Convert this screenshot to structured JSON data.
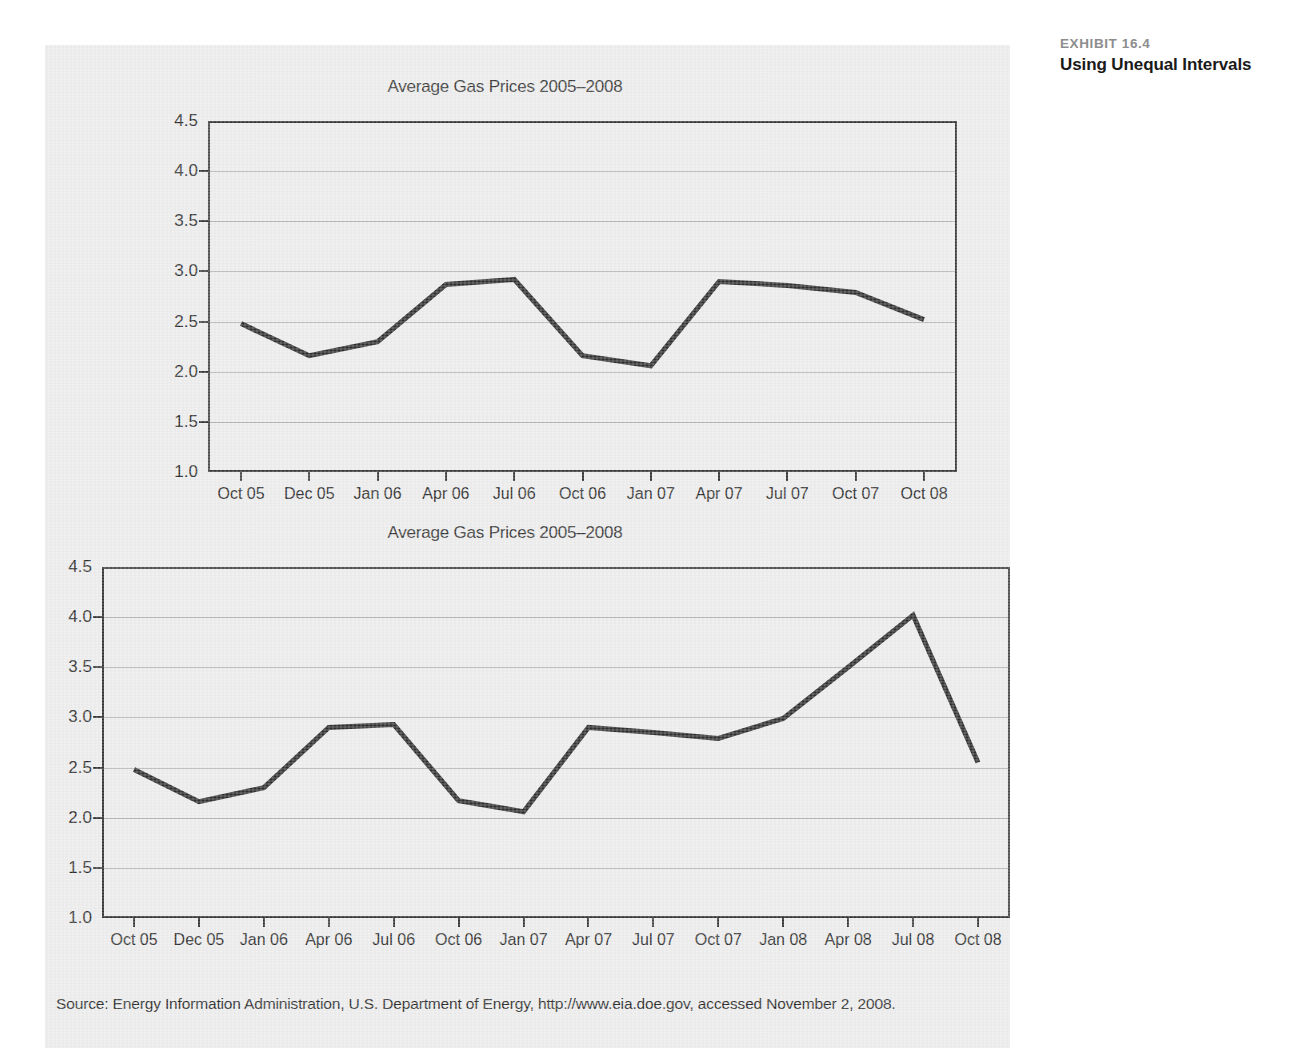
{
  "exhibit": {
    "number": "EXHIBIT 16.4",
    "title": "Using Unequal Intervals"
  },
  "credit": "COURTESY, ENERGY INFORMATION SERVICE, U.S. GOVERNMENT",
  "source_note": "Source: Energy Information Administration, U.S. Department of Energy, http://www.eia.doe.gov, accessed November 2, 2008.",
  "colors": {
    "panel_background": "#ebebeb",
    "line": "#222222",
    "axis": "#2a2a2a",
    "grid": "#9a9a9a",
    "text": "#1d1d1d",
    "exhibit_number": "#8d8d8d"
  },
  "chart_data": [
    {
      "type": "line",
      "id": "top-chart",
      "title": "Average Gas Prices 2005–2008",
      "xlabel": "",
      "ylabel": "",
      "ylim": [
        1.0,
        4.5
      ],
      "yticks": [
        "4.5",
        "4.0",
        "3.5",
        "3.0",
        "2.5",
        "2.0",
        "1.5",
        "1.0"
      ],
      "ytick_values": [
        4.5,
        4.0,
        3.5,
        3.0,
        2.5,
        2.0,
        1.5,
        1.0
      ],
      "grid": true,
      "legend": "none",
      "categories": [
        "Oct 05",
        "Dec 05",
        "Jan 06",
        "Apr 06",
        "Jul 06",
        "Oct 06",
        "Jan 07",
        "Apr 07",
        "Jul 07",
        "Oct 07",
        "Oct 08"
      ],
      "values": [
        2.48,
        2.16,
        2.3,
        2.87,
        2.92,
        2.16,
        2.06,
        2.9,
        2.86,
        2.79,
        2.52
      ],
      "note": "Category axis uses unequal time intervals spaced evenly, compressing Oct 07 to Oct 08."
    },
    {
      "type": "line",
      "id": "bottom-chart",
      "title": "Average Gas Prices 2005–2008",
      "xlabel": "",
      "ylabel": "",
      "ylim": [
        1.0,
        4.5
      ],
      "yticks": [
        "4.5",
        "4.0",
        "3.5",
        "3.0",
        "2.5",
        "2.0",
        "1.5",
        "1.0"
      ],
      "ytick_values": [
        4.5,
        4.0,
        3.5,
        3.0,
        2.5,
        2.0,
        1.5,
        1.0
      ],
      "grid": true,
      "legend": "none",
      "categories": [
        "Oct 05",
        "Dec 05",
        "Jan 06",
        "Apr 06",
        "Jul 06",
        "Oct 06",
        "Jan 07",
        "Apr 07",
        "Jul 07",
        "Oct 07",
        "Jan 08",
        "Apr 08",
        "Jul 08",
        "Oct 08"
      ],
      "values": [
        2.48,
        2.16,
        2.3,
        2.9,
        2.93,
        2.17,
        2.06,
        2.9,
        2.85,
        2.79,
        2.99,
        3.5,
        4.02,
        2.55
      ],
      "note": "Same series shown with all quarterly intervals included."
    }
  ]
}
